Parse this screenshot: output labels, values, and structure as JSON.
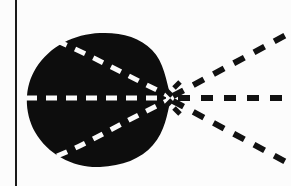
{
  "figure": {
    "caption": "",
    "width_px": 291,
    "height_px": 186,
    "background_color": "#fcfcfc",
    "ink_color": "#0d0d0d",
    "highlight_color": "#fbfbfb"
  },
  "border": {
    "left_rule": {
      "name": "left-vertical-rule",
      "x": 16,
      "y_start": 0,
      "y_end": 186,
      "stroke_width": 2,
      "color": "#1a1a1a"
    }
  },
  "focus": {
    "label": "",
    "x": 171,
    "y": 98
  },
  "blob": {
    "name": "solid-wavefront-region",
    "fill": "#0d0d0d",
    "bounds": {
      "left": 26,
      "right": 172,
      "top": 33,
      "bottom": 168
    },
    "path": "M 171 98 C 166 80 164 62 152 50 C 140 37 120 32 100 33 C 74 34 50 46 36 68 C 24 87 24 112 35 132 C 48 155 74 168 100 167 C 122 166 141 159 153 145 C 165 131 167 115 171 98 Z"
  },
  "inner_dashes": {
    "color": "#fbfbfb",
    "stroke_width": 5,
    "dash_pattern": "11 9",
    "lines": [
      {
        "name": "inner-dash-upper",
        "path": "M 57 41 C 86 53 120 72 171 97",
        "from": [
          57,
          41
        ],
        "to": [
          171,
          97
        ]
      },
      {
        "name": "inner-dash-middle",
        "path": "M 26 98 L 171 98",
        "from": [
          26,
          98
        ],
        "to": [
          171,
          98
        ]
      },
      {
        "name": "inner-dash-lower",
        "path": "M 57 156 C 86 145 120 123 171 99",
        "from": [
          57,
          156
        ],
        "to": [
          171,
          99
        ]
      }
    ]
  },
  "outer_rays": {
    "color": "#111111",
    "stroke_width": 6,
    "dash_pattern": "12 11",
    "rays": [
      {
        "name": "ray-upper-right",
        "from": [
          173,
          96
        ],
        "to": [
          288,
          34
        ],
        "angle_deg": 28.3
      },
      {
        "name": "ray-horizontal-right",
        "from": [
          178,
          98
        ],
        "to": [
          291,
          98
        ],
        "angle_deg": 0
      },
      {
        "name": "ray-lower-right",
        "from": [
          173,
          101
        ],
        "to": [
          288,
          163
        ],
        "angle_deg": -28.3
      }
    ]
  },
  "cusp_sparks": {
    "name": "focal-point-spark-cluster",
    "color": "#111111",
    "count": 4,
    "segments": [
      {
        "from": [
          174,
          88
        ],
        "to": [
          180,
          82
        ]
      },
      {
        "from": [
          174,
          108
        ],
        "to": [
          180,
          114
        ]
      },
      {
        "from": [
          166,
          90
        ],
        "to": [
          172,
          96
        ]
      },
      {
        "from": [
          166,
          106
        ],
        "to": [
          172,
          100
        ]
      }
    ]
  }
}
